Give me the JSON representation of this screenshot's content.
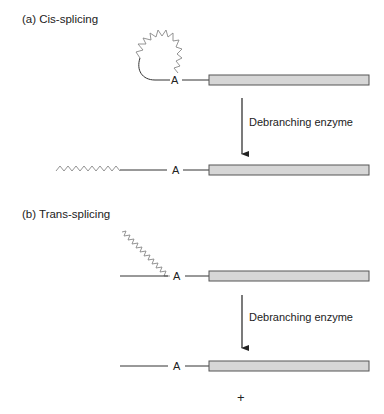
{
  "panel_a": {
    "title": "(a) Cis-splicing",
    "branch_label": "A",
    "arrow_label": "Debranching enzyme",
    "product_branch_label": "A"
  },
  "panel_b": {
    "title": "(b) Trans-splicing",
    "branch_label": "A",
    "arrow_label": "Debranching enzyme",
    "product_branch_label": "A",
    "plus_sign": "+"
  },
  "colors": {
    "line": "#333333",
    "intron_wavy": "#888888",
    "exon_fill": "#d6d6d6",
    "exon_stroke": "#555555"
  }
}
